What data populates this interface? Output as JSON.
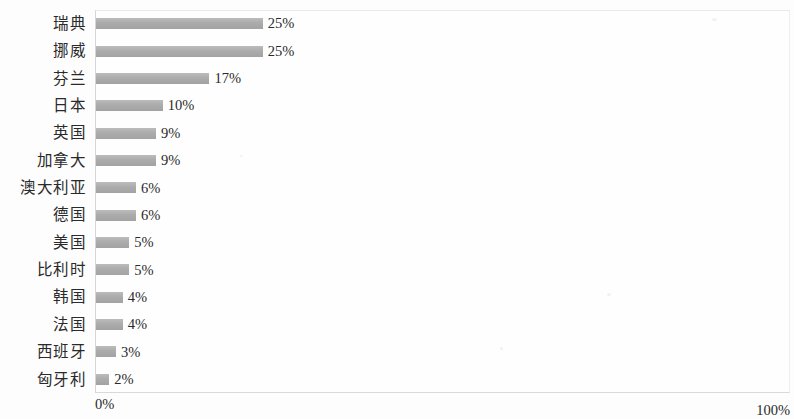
{
  "chart_data": {
    "type": "bar",
    "orientation": "horizontal",
    "title": "",
    "subtitle": "",
    "xlabel": "",
    "ylabel": "",
    "xlim": [
      0,
      100
    ],
    "x_tick_labels": [
      "0%",
      "100%"
    ],
    "grid": false,
    "legend": null,
    "bar_color": "#a9a9a9",
    "categories": [
      "瑞典",
      "挪威",
      "芬兰",
      "日本",
      "英国",
      "加拿大",
      "澳大利亚",
      "德国",
      "美国",
      "比利时",
      "韩国",
      "法国",
      "西班牙",
      "匈牙利"
    ],
    "values": [
      25,
      25,
      17,
      10,
      9,
      9,
      6,
      6,
      5,
      5,
      4,
      4,
      3,
      2
    ],
    "value_labels": [
      "25%",
      "25%",
      "17%",
      "10%",
      "9%",
      "9%",
      "6%",
      "6%",
      "5%",
      "5%",
      "4%",
      "4%",
      "3%",
      "2%"
    ],
    "rows": [
      {
        "category": "瑞典",
        "value": 25,
        "label": "25%"
      },
      {
        "category": "挪威",
        "value": 25,
        "label": "25%"
      },
      {
        "category": "芬兰",
        "value": 17,
        "label": "17%"
      },
      {
        "category": "日本",
        "value": 10,
        "label": "10%"
      },
      {
        "category": "英国",
        "value": 9,
        "label": "9%"
      },
      {
        "category": "加拿大",
        "value": 9,
        "label": "9%"
      },
      {
        "category": "澳大利亚",
        "value": 6,
        "label": "6%"
      },
      {
        "category": "德国",
        "value": 6,
        "label": "6%"
      },
      {
        "category": "美国",
        "value": 5,
        "label": "5%"
      },
      {
        "category": "比利时",
        "value": 5,
        "label": "5%"
      },
      {
        "category": "韩国",
        "value": 4,
        "label": "4%"
      },
      {
        "category": "法国",
        "value": 4,
        "label": "4%"
      },
      {
        "category": "西班牙",
        "value": 3,
        "label": "3%"
      },
      {
        "category": "匈牙利",
        "value": 2,
        "label": "2%"
      }
    ]
  },
  "axis": {
    "min_label": "0%",
    "max_label": "100%"
  }
}
